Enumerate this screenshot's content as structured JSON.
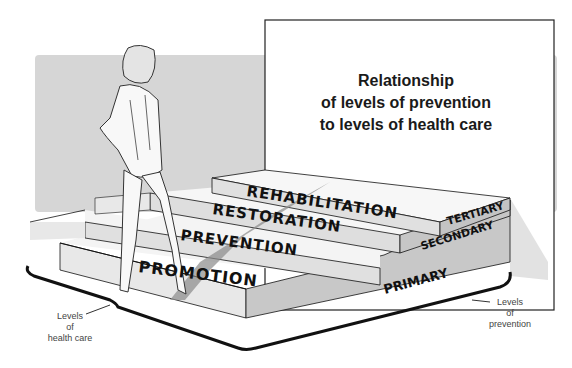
{
  "title": {
    "line1": "Relationship",
    "line2": "of levels of prevention",
    "line3": "to levels of health care"
  },
  "steps": [
    {
      "health_care_level": "PROMOTION",
      "prevention_level": "PRIMARY"
    },
    {
      "health_care_level": "PREVENTION",
      "prevention_level": "PRIMARY"
    },
    {
      "health_care_level": "RESTORATION",
      "prevention_level": "SECONDARY"
    },
    {
      "health_care_level": "REHABILITATION",
      "prevention_level": "TERTIARY"
    }
  ],
  "health_care_labels": {
    "promotion": "PROMOTION",
    "prevention": "PREVENTION",
    "restoration": "RESTORATION",
    "rehabilitation": "REHABILITATION"
  },
  "prevention_labels": {
    "primary": "PRIMARY",
    "secondary": "SECONDARY",
    "tertiary": "TERTIARY"
  },
  "axes": {
    "health_care": {
      "line1": "Levels",
      "line2": "of",
      "line3": "health care"
    },
    "prevention": {
      "line1": "Levels",
      "line2": "of",
      "line3": "prevention"
    }
  },
  "colors": {
    "background_panel": "#d6d6d6",
    "step_top": "#f4f4f4",
    "step_front": "#dcdcdc",
    "step_side": "#c4c4c4",
    "outline": "#111111"
  }
}
